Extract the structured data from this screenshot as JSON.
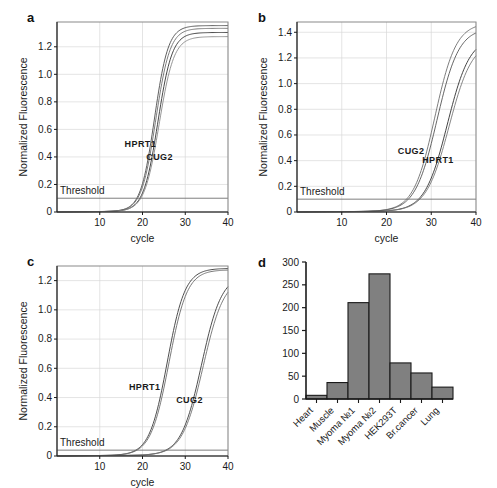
{
  "figure": {
    "title": "",
    "panels": [
      "a",
      "b",
      "c",
      "d"
    ]
  },
  "panel_a": {
    "letter": "a",
    "xlabel": "cycle",
    "ylabel": "Normalized Fluorescence",
    "threshold_label": "Threshold",
    "series_labels": {
      "first": "HPRT1",
      "second": "CUG2"
    }
  },
  "panel_b": {
    "letter": "b",
    "xlabel": "cycle",
    "ylabel": "Normalized Fluorescence",
    "threshold_label": "Threshold",
    "series_labels": {
      "first": "CUG2",
      "second": "HPRT1"
    }
  },
  "panel_c": {
    "letter": "c",
    "xlabel": "cycle",
    "ylabel": "Normalized Fluorescence",
    "threshold_label": "Threshold",
    "series_labels": {
      "first": "HPRT1",
      "second": "CUG2"
    }
  },
  "panel_d": {
    "letter": "d"
  },
  "chart_data": [
    {
      "id": "a",
      "type": "line",
      "title": "",
      "xlabel": "cycle",
      "ylabel": "Normalized Fluorescence",
      "xlim": [
        0,
        40
      ],
      "ylim": [
        0,
        1.38
      ],
      "xticks": [
        10,
        20,
        30,
        40
      ],
      "yticks": [
        0,
        0.2,
        0.4,
        0.6,
        0.8,
        1.0,
        1.2
      ],
      "ytick_labels": [
        "0",
        "0.2",
        "0.4",
        "0.6",
        "0.8",
        "1.0",
        "1.2"
      ],
      "grid": true,
      "threshold": {
        "value": 0.1,
        "label": "Threshold"
      },
      "annotations": [
        {
          "text": "HPRT1",
          "x": 19.5,
          "y": 0.47
        },
        {
          "text": "CUG2",
          "x": 24.0,
          "y": 0.38
        }
      ],
      "series": [
        {
          "name": "HPRT1",
          "color": "#4d4d4d",
          "ct": 16.6,
          "midpoint": 22.8,
          "slope": 0.62,
          "plateau": 1.35
        },
        {
          "name": "HPRT1-rep",
          "color": "#6e6e6e",
          "ct": 16.9,
          "midpoint": 23.1,
          "slope": 0.6,
          "plateau": 1.33
        },
        {
          "name": "CUG2",
          "color": "#333333",
          "ct": 17.4,
          "midpoint": 23.6,
          "slope": 0.6,
          "plateau": 1.3
        },
        {
          "name": "CUG2-rep",
          "color": "#8a8a8a",
          "ct": 17.7,
          "midpoint": 23.9,
          "slope": 0.58,
          "plateau": 1.27
        }
      ]
    },
    {
      "id": "b",
      "type": "line",
      "title": "",
      "xlabel": "cycle",
      "ylabel": "Normalized Fluorescence",
      "xlim": [
        0,
        40
      ],
      "ylim": [
        0,
        1.48
      ],
      "xticks": [
        10,
        20,
        30,
        40
      ],
      "yticks": [
        0,
        0.2,
        0.4,
        0.6,
        0.8,
        1.0,
        1.2,
        1.4
      ],
      "ytick_labels": [
        "0",
        "0.2",
        "0.4",
        "0.6",
        "0.8",
        "1.0",
        "1.2",
        "1.4"
      ],
      "grid": true,
      "threshold": {
        "value": 0.1,
        "label": "Threshold"
      },
      "annotations": [
        {
          "text": "CUG2",
          "x": 25.5,
          "y": 0.45
        },
        {
          "text": "HPRT1",
          "x": 31.5,
          "y": 0.38
        }
      ],
      "series": [
        {
          "name": "CUG2",
          "color": "#6e6e6e",
          "ct": 23.8,
          "midpoint": 30.8,
          "slope": 0.42,
          "plateau": 1.47
        },
        {
          "name": "CUG2-rep",
          "color": "#555555",
          "ct": 24.2,
          "midpoint": 31.3,
          "slope": 0.41,
          "plateau": 1.43
        },
        {
          "name": "HPRT1",
          "color": "#2f2f2f",
          "ct": 26.8,
          "midpoint": 33.6,
          "slope": 0.4,
          "plateau": 1.36
        },
        {
          "name": "HPRT1-rep",
          "color": "#777777",
          "ct": 27.2,
          "midpoint": 34.0,
          "slope": 0.39,
          "plateau": 1.33
        }
      ]
    },
    {
      "id": "c",
      "type": "line",
      "title": "",
      "xlabel": "cycle",
      "ylabel": "Normalized Fluorescence",
      "xlim": [
        0,
        40
      ],
      "ylim": [
        0,
        1.3
      ],
      "xticks": [
        10,
        20,
        30,
        40
      ],
      "yticks": [
        0,
        0.2,
        0.4,
        0.6,
        0.8,
        1.0,
        1.2
      ],
      "ytick_labels": [
        "0",
        "0.2",
        "0.4",
        "0.6",
        "0.8",
        "1.0",
        "1.2"
      ],
      "grid": true,
      "threshold": {
        "value": 0.04,
        "label": "Threshold"
      },
      "annotations": [
        {
          "text": "HPRT1",
          "x": 20.5,
          "y": 0.45
        },
        {
          "text": "CUG2",
          "x": 31.0,
          "y": 0.36
        }
      ],
      "series": [
        {
          "name": "HPRT1",
          "color": "#3a3a3a",
          "ct": 19.0,
          "midpoint": 25.8,
          "slope": 0.48,
          "plateau": 1.28
        },
        {
          "name": "HPRT1-rep",
          "color": "#6a6a6a",
          "ct": 19.4,
          "midpoint": 26.2,
          "slope": 0.47,
          "plateau": 1.27
        },
        {
          "name": "CUG2",
          "color": "#3a3a3a",
          "ct": 26.5,
          "midpoint": 33.8,
          "slope": 0.42,
          "plateau": 1.24
        },
        {
          "name": "CUG2-rep",
          "color": "#707070",
          "ct": 26.9,
          "midpoint": 34.2,
          "slope": 0.41,
          "plateau": 1.22
        }
      ]
    },
    {
      "id": "d",
      "type": "bar",
      "title": "",
      "xlabel": "",
      "ylabel": "",
      "categories": [
        "Heart",
        "Muscle",
        "Myoma №1",
        "Myoma №2",
        "HEK293T",
        "Br.cancer",
        "Lung"
      ],
      "values": [
        8,
        36,
        211,
        274,
        79,
        57,
        26
      ],
      "ylim": [
        0,
        300
      ],
      "yticks": [
        0,
        50,
        100,
        150,
        200,
        250,
        300
      ],
      "ytick_labels": [
        "0",
        "50",
        "100",
        "150",
        "200",
        "250",
        "300"
      ],
      "grid": false,
      "bar_color": "#808080",
      "bar_edge_color": "#1a1a1a",
      "label_rotation": -45
    }
  ]
}
